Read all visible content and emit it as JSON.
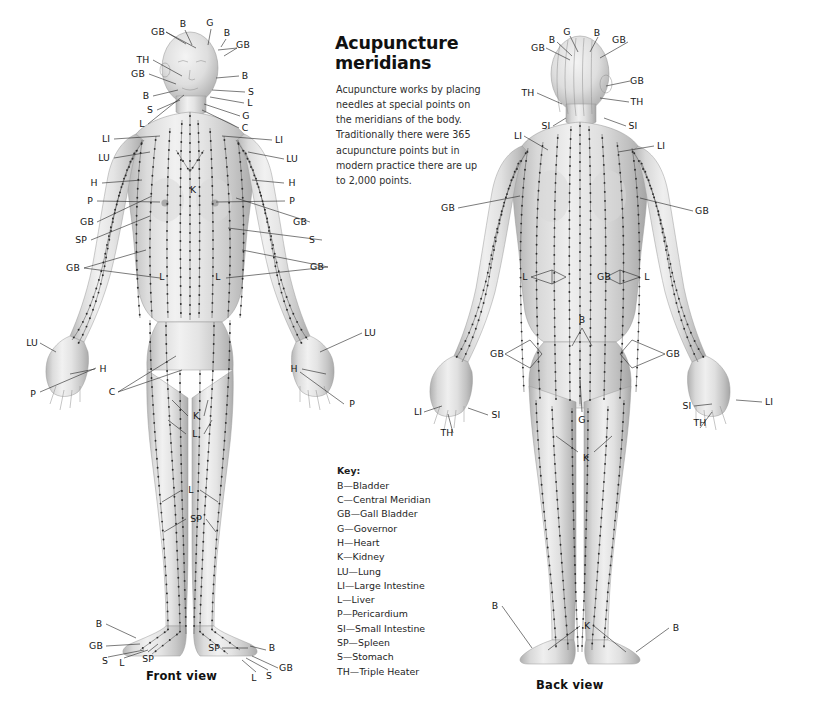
{
  "article": {
    "title": "Acupuncture meridians",
    "title_line1": "Acupuncture",
    "title_line2": "meridians",
    "intro": "Acupuncture works by placing needles at special points on the meridians of the body. Traditionally there were 365 acupuncture points but in modern practice there are up to 2,000 points."
  },
  "key": {
    "heading": "Key:",
    "entries": [
      {
        "abbr": "B",
        "name": "Bladder",
        "text": "B—Bladder"
      },
      {
        "abbr": "C",
        "name": "Central Meridian",
        "text": "C—Central Meridian"
      },
      {
        "abbr": "GB",
        "name": "Gall Bladder",
        "text": "GB—Gall Bladder"
      },
      {
        "abbr": "G",
        "name": "Governor",
        "text": "G—Governor"
      },
      {
        "abbr": "H",
        "name": "Heart",
        "text": "H—Heart"
      },
      {
        "abbr": "K",
        "name": "Kidney",
        "text": "K—Kidney"
      },
      {
        "abbr": "LU",
        "name": "Lung",
        "text": "LU—Lung"
      },
      {
        "abbr": "LI",
        "name": "Large Intestine",
        "text": "LI—Large Intestine"
      },
      {
        "abbr": "L",
        "name": "Liver",
        "text": "L—Liver"
      },
      {
        "abbr": "P",
        "name": "Pericardium",
        "text": "P—Pericardium"
      },
      {
        "abbr": "SI",
        "name": "Small Intestine",
        "text": "SI—Small Intestine"
      },
      {
        "abbr": "SP",
        "name": "Spleen",
        "text": "SP—Spleen"
      },
      {
        "abbr": "S",
        "name": "Stomach",
        "text": "S—Stomach"
      },
      {
        "abbr": "TH",
        "name": "Triple Heater",
        "text": "TH—Triple Heater"
      }
    ]
  },
  "figures": {
    "front": {
      "caption": "Front view",
      "labels": [
        {
          "text": "GB",
          "x": 158,
          "y": 32
        },
        {
          "text": "B",
          "x": 183,
          "y": 24
        },
        {
          "text": "G",
          "x": 210,
          "y": 23
        },
        {
          "text": "B",
          "x": 227,
          "y": 33
        },
        {
          "text": "GB",
          "x": 243,
          "y": 45
        },
        {
          "text": "TH",
          "x": 143,
          "y": 60
        },
        {
          "text": "GB",
          "x": 138,
          "y": 74
        },
        {
          "text": "B",
          "x": 146,
          "y": 96
        },
        {
          "text": "S",
          "x": 150,
          "y": 110
        },
        {
          "text": "L",
          "x": 142,
          "y": 124
        },
        {
          "text": "B",
          "x": 245,
          "y": 76
        },
        {
          "text": "S",
          "x": 251,
          "y": 92
        },
        {
          "text": "L",
          "x": 250,
          "y": 103
        },
        {
          "text": "G",
          "x": 246,
          "y": 116
        },
        {
          "text": "C",
          "x": 245,
          "y": 128
        },
        {
          "text": "LI",
          "x": 106,
          "y": 139
        },
        {
          "text": "LI",
          "x": 279,
          "y": 140
        },
        {
          "text": "LU",
          "x": 104,
          "y": 158
        },
        {
          "text": "LU",
          "x": 292,
          "y": 159
        },
        {
          "text": "H",
          "x": 94,
          "y": 183
        },
        {
          "text": "H",
          "x": 292,
          "y": 183
        },
        {
          "text": "P",
          "x": 90,
          "y": 201
        },
        {
          "text": "P",
          "x": 292,
          "y": 201
        },
        {
          "text": "GB",
          "x": 87,
          "y": 222
        },
        {
          "text": "GB",
          "x": 300,
          "y": 222
        },
        {
          "text": "SP",
          "x": 81,
          "y": 240
        },
        {
          "text": "S",
          "x": 312,
          "y": 240
        },
        {
          "text": "GB",
          "x": 73,
          "y": 268
        },
        {
          "text": "GB",
          "x": 317,
          "y": 267
        },
        {
          "text": "L",
          "x": 162,
          "y": 277
        },
        {
          "text": "L",
          "x": 218,
          "y": 277
        },
        {
          "text": "K",
          "x": 193,
          "y": 190
        },
        {
          "text": "LU",
          "x": 32,
          "y": 343
        },
        {
          "text": "LU",
          "x": 370,
          "y": 333
        },
        {
          "text": "H",
          "x": 103,
          "y": 369
        },
        {
          "text": "H",
          "x": 294,
          "y": 369
        },
        {
          "text": "P",
          "x": 33,
          "y": 394
        },
        {
          "text": "P",
          "x": 352,
          "y": 404
        },
        {
          "text": "C",
          "x": 112,
          "y": 392
        },
        {
          "text": "K",
          "x": 196,
          "y": 416
        },
        {
          "text": "L",
          "x": 195,
          "y": 434
        },
        {
          "text": "L",
          "x": 191,
          "y": 490
        },
        {
          "text": "SP",
          "x": 196,
          "y": 519
        },
        {
          "text": "B",
          "x": 99,
          "y": 624
        },
        {
          "text": "GB",
          "x": 96,
          "y": 646
        },
        {
          "text": "S",
          "x": 105,
          "y": 661
        },
        {
          "text": "L",
          "x": 122,
          "y": 663
        },
        {
          "text": "SP",
          "x": 148,
          "y": 659
        },
        {
          "text": "SP",
          "x": 214,
          "y": 648
        },
        {
          "text": "B",
          "x": 272,
          "y": 648
        },
        {
          "text": "GB",
          "x": 286,
          "y": 668
        },
        {
          "text": "S",
          "x": 269,
          "y": 676
        },
        {
          "text": "L",
          "x": 254,
          "y": 678
        }
      ]
    },
    "back": {
      "caption": "Back view",
      "labels": [
        {
          "text": "GB",
          "x": 538,
          "y": 48
        },
        {
          "text": "B",
          "x": 552,
          "y": 40
        },
        {
          "text": "G",
          "x": 567,
          "y": 32
        },
        {
          "text": "B",
          "x": 597,
          "y": 33
        },
        {
          "text": "GB",
          "x": 619,
          "y": 40
        },
        {
          "text": "GB",
          "x": 637,
          "y": 81
        },
        {
          "text": "TH",
          "x": 528,
          "y": 93
        },
        {
          "text": "TH",
          "x": 637,
          "y": 102
        },
        {
          "text": "SI",
          "x": 546,
          "y": 126
        },
        {
          "text": "SI",
          "x": 633,
          "y": 126
        },
        {
          "text": "LI",
          "x": 518,
          "y": 136
        },
        {
          "text": "LI",
          "x": 661,
          "y": 146
        },
        {
          "text": "GB",
          "x": 448,
          "y": 208
        },
        {
          "text": "GB",
          "x": 702,
          "y": 211
        },
        {
          "text": "L",
          "x": 525,
          "y": 277
        },
        {
          "text": "GB",
          "x": 604,
          "y": 277
        },
        {
          "text": "L",
          "x": 647,
          "y": 277
        },
        {
          "text": "B",
          "x": 582,
          "y": 320
        },
        {
          "text": "GB",
          "x": 497,
          "y": 354
        },
        {
          "text": "GB",
          "x": 673,
          "y": 354
        },
        {
          "text": "LI",
          "x": 418,
          "y": 412
        },
        {
          "text": "SI",
          "x": 496,
          "y": 415
        },
        {
          "text": "TH",
          "x": 447,
          "y": 433
        },
        {
          "text": "SI",
          "x": 687,
          "y": 406
        },
        {
          "text": "LI",
          "x": 769,
          "y": 402
        },
        {
          "text": "TH",
          "x": 700,
          "y": 423
        },
        {
          "text": "G",
          "x": 582,
          "y": 420
        },
        {
          "text": "K",
          "x": 586,
          "y": 458
        },
        {
          "text": "B",
          "x": 495,
          "y": 606
        },
        {
          "text": "K",
          "x": 587,
          "y": 626
        },
        {
          "text": "B",
          "x": 676,
          "y": 628
        }
      ]
    }
  },
  "colors": {
    "background": "#ffffff",
    "text": "#1a1a1a",
    "leader_line": "#2b2b2b",
    "meridian_line": "#4a4a4a",
    "point": "#2a2a2a",
    "skin_light": "#f0f0f0",
    "skin_mid": "#d2d2d2",
    "skin_dark": "#a8a8a8"
  }
}
